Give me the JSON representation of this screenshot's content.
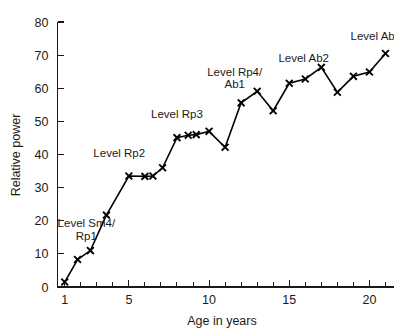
{
  "chart_data": {
    "type": "line",
    "title": "",
    "xlabel": "Age in years",
    "ylabel": "Relative power",
    "xlim": [
      0.55,
      21.5
    ],
    "ylim": [
      0,
      80
    ],
    "grid": false,
    "legend": null,
    "marker": "x",
    "line_color": "#000000",
    "x_ticks_major": [
      1,
      5,
      10,
      15,
      20
    ],
    "x_tick_labels": [
      "1",
      "5",
      "10",
      "15",
      "20"
    ],
    "x_ticks_minor": [
      1,
      2,
      3,
      4,
      5,
      6,
      7,
      8,
      9,
      10,
      11,
      12,
      13,
      14,
      15,
      16,
      17,
      18,
      19,
      20,
      21
    ],
    "y_ticks_major": [
      0,
      10,
      20,
      30,
      40,
      50,
      60,
      70,
      80
    ],
    "y_tick_labels": [
      "0",
      "10",
      "20",
      "30",
      "40",
      "50",
      "60",
      "70",
      "80"
    ],
    "x": [
      1,
      1.8,
      2.6,
      3.6,
      5.0,
      6.0,
      6.5,
      7.1,
      8.0,
      8.7,
      9.2,
      10.0,
      11.0,
      12.0,
      13.0,
      14.0,
      15.0,
      16.0,
      17.0,
      18.0,
      19.0,
      20.0,
      21.0
    ],
    "values": [
      1.5,
      8.3,
      11.0,
      21.7,
      33.5,
      33.4,
      33.5,
      36.0,
      45.1,
      45.8,
      46.0,
      47.0,
      42.2,
      55.6,
      59.1,
      53.2,
      61.5,
      62.8,
      66.3,
      58.8,
      63.6,
      64.9,
      70.5
    ],
    "annotations": [
      {
        "id": "level-sm4-rp1",
        "lines": [
          "Level Sm4/",
          "Rp1"
        ],
        "x": 2.35,
        "y": 18.0,
        "align": "middle"
      },
      {
        "id": "level-rp2",
        "lines": [
          "Level Rp2"
        ],
        "x": 4.4,
        "y": 39.2,
        "align": "middle"
      },
      {
        "id": "level-rp3",
        "lines": [
          "Level Rp3"
        ],
        "x": 8.0,
        "y": 51.0,
        "align": "middle"
      },
      {
        "id": "level-rp4-ab1",
        "lines": [
          "Level Rp4/",
          "Ab1"
        ],
        "x": 11.6,
        "y": 63.8,
        "align": "middle"
      },
      {
        "id": "level-ab2",
        "lines": [
          "Level Ab2"
        ],
        "x": 15.9,
        "y": 68.0,
        "align": "middle"
      },
      {
        "id": "level-ab3",
        "lines": [
          "Level Ab"
        ],
        "x": 20.2,
        "y": 74.6,
        "align": "middle"
      }
    ]
  },
  "axis": {
    "y_title": "Relative power",
    "x_title": "Age in years"
  },
  "colors": {
    "line": "#000000",
    "axis": "#1a1a1a",
    "background": "#ffffff"
  }
}
